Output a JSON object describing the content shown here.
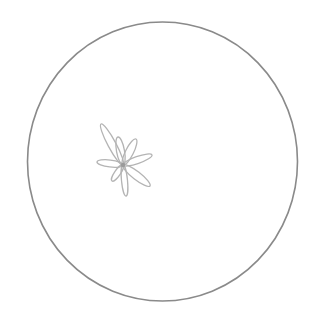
{
  "image": {
    "background": "#ffffff",
    "circle": {
      "cx": 162.5,
      "cy": 161.5,
      "rx": 135,
      "ry": 139.5,
      "stroke": "#8a8a8a",
      "stroke_width": 1.6
    },
    "flower": {
      "center": [
        123,
        165
      ],
      "stroke": "#b4b4b4",
      "center_color": "#909090",
      "petals": [
        {
          "name": "upper-left-long",
          "tip": [
            101,
            124
          ],
          "width": 8
        },
        {
          "name": "up",
          "tip": [
            118,
            137
          ],
          "width": 8
        },
        {
          "name": "upper-right",
          "tip": [
            136,
            139
          ],
          "width": 8
        },
        {
          "name": "right",
          "tip": [
            152,
            155
          ],
          "width": 7
        },
        {
          "name": "lower-right",
          "tip": [
            150,
            186
          ],
          "width": 8
        },
        {
          "name": "down",
          "tip": [
            126,
            196
          ],
          "width": 6
        },
        {
          "name": "lower-left",
          "tip": [
            112,
            181
          ],
          "width": 6
        },
        {
          "name": "left",
          "tip": [
            97,
            162
          ],
          "width": 7
        }
      ]
    }
  }
}
